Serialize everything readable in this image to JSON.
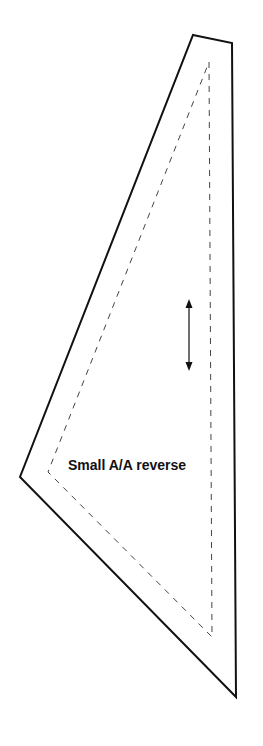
{
  "pattern": {
    "label": "Small A/A reverse",
    "cut_line": {
      "style": "solid",
      "color": "#111111",
      "points": [
        [
          193,
          35
        ],
        [
          232,
          43
        ],
        [
          236,
          697
        ],
        [
          20,
          477
        ]
      ]
    },
    "seam_line": {
      "style": "dashed",
      "color": "#444444",
      "points": [
        [
          209,
          62
        ],
        [
          212,
          637
        ],
        [
          48,
          472
        ]
      ]
    },
    "grainline_arrow": {
      "icon": "double-headed-vertical-arrow",
      "x": 189,
      "y_top": 300,
      "y_bottom": 370
    }
  }
}
